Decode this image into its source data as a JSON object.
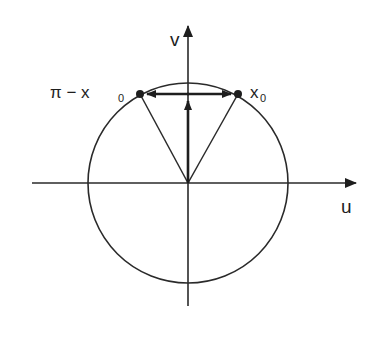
{
  "diagram": {
    "axes": {
      "horizontal_label": "u",
      "vertical_label": "v"
    },
    "points": {
      "left": {
        "label_main": "π − x",
        "label_sub": "0"
      },
      "right": {
        "label_main": "x",
        "label_sub": "0"
      }
    },
    "colors": {
      "stroke": "#2a2a2a",
      "background": "#ffffff"
    }
  }
}
